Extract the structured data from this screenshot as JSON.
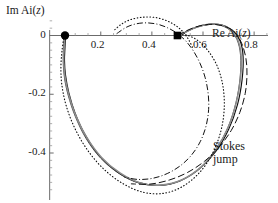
{
  "figure": {
    "kind": "complex-plane-trajectory-plot",
    "width": 278,
    "height": 203,
    "background": "#ffffff"
  },
  "axes": {
    "x_title": "Re Ai(z)",
    "y_title": "Im Ai(z)",
    "x_ticks": [
      {
        "value": 0.2,
        "label": "0.2"
      },
      {
        "value": 0.4,
        "label": "0.4"
      },
      {
        "value": 0.6,
        "label": "0.6"
      },
      {
        "value": 0.8,
        "label": "0.8"
      }
    ],
    "y_ticks": [
      {
        "value": 0.0,
        "label": "0"
      },
      {
        "value": -0.2,
        "label": "-0.2"
      },
      {
        "value": -0.4,
        "label": "-0.4"
      }
    ],
    "x_range": [
      -0.03,
      0.87
    ],
    "y_range": [
      -0.56,
      0.08
    ],
    "axis_color": "#6b6b6b"
  },
  "markers": [
    {
      "name": "start-dot",
      "shape": "circle",
      "x": 0.06,
      "y": 0.0
    },
    {
      "name": "stokes-point-square",
      "shape": "square",
      "x": 0.5,
      "y": 0.0
    }
  ],
  "annotations": [
    {
      "name": "stokes-jump-label",
      "line1": "Stokes",
      "line2": "jump"
    }
  ],
  "chart_data": {
    "type": "line",
    "title": "",
    "xlabel": "Re Ai(z)",
    "ylabel": "Im Ai(z)",
    "xlim": [
      -0.03,
      0.87
    ],
    "ylim": [
      -0.56,
      0.08
    ],
    "grid": false,
    "legend": "none",
    "series": [
      {
        "name": "solid-outer-loop",
        "style": "solid",
        "color": "#111111",
        "points": [
          [
            0.062,
            0.0
          ],
          [
            0.06,
            -0.04
          ],
          [
            0.058,
            -0.085
          ],
          [
            0.062,
            -0.135
          ],
          [
            0.075,
            -0.195
          ],
          [
            0.1,
            -0.265
          ],
          [
            0.14,
            -0.34
          ],
          [
            0.195,
            -0.41
          ],
          [
            0.265,
            -0.465
          ],
          [
            0.345,
            -0.5
          ],
          [
            0.43,
            -0.51
          ],
          [
            0.51,
            -0.495
          ],
          [
            0.585,
            -0.455
          ],
          [
            0.65,
            -0.395
          ],
          [
            0.7,
            -0.32
          ],
          [
            0.735,
            -0.235
          ],
          [
            0.753,
            -0.15
          ],
          [
            0.757,
            -0.072
          ],
          [
            0.745,
            -0.018
          ],
          [
            0.715,
            0.018
          ],
          [
            0.672,
            0.036
          ],
          [
            0.625,
            0.038
          ],
          [
            0.578,
            0.03
          ],
          [
            0.54,
            0.016
          ],
          [
            0.512,
            0.002
          ],
          [
            0.5,
            0.0
          ]
        ]
      },
      {
        "name": "solid-inner-loop",
        "style": "solid",
        "color": "#2a2a2a",
        "points": [
          [
            0.057,
            0.0
          ],
          [
            0.054,
            -0.045
          ],
          [
            0.053,
            -0.092
          ],
          [
            0.058,
            -0.145
          ],
          [
            0.073,
            -0.205
          ],
          [
            0.1,
            -0.275
          ],
          [
            0.142,
            -0.35
          ],
          [
            0.2,
            -0.418
          ],
          [
            0.272,
            -0.47
          ],
          [
            0.352,
            -0.503
          ],
          [
            0.436,
            -0.51
          ],
          [
            0.516,
            -0.492
          ],
          [
            0.589,
            -0.45
          ],
          [
            0.65,
            -0.388
          ],
          [
            0.698,
            -0.312
          ],
          [
            0.729,
            -0.228
          ],
          [
            0.745,
            -0.145
          ],
          [
            0.747,
            -0.068
          ],
          [
            0.733,
            -0.014
          ],
          [
            0.703,
            0.02
          ],
          [
            0.662,
            0.036
          ],
          [
            0.618,
            0.037
          ],
          [
            0.575,
            0.028
          ],
          [
            0.538,
            0.014
          ],
          [
            0.51,
            0.001
          ],
          [
            0.5,
            0.0
          ]
        ]
      },
      {
        "name": "gray-underlay-loop",
        "style": "solid",
        "color": "#8d8d8d",
        "points": [
          [
            0.059,
            0.0
          ],
          [
            0.056,
            -0.043
          ],
          [
            0.055,
            -0.09
          ],
          [
            0.06,
            -0.142
          ],
          [
            0.075,
            -0.202
          ],
          [
            0.102,
            -0.272
          ],
          [
            0.145,
            -0.347
          ],
          [
            0.203,
            -0.415
          ],
          [
            0.275,
            -0.468
          ],
          [
            0.355,
            -0.502
          ],
          [
            0.438,
            -0.509
          ],
          [
            0.518,
            -0.491
          ],
          [
            0.591,
            -0.449
          ],
          [
            0.652,
            -0.386
          ],
          [
            0.7,
            -0.31
          ],
          [
            0.731,
            -0.226
          ],
          [
            0.747,
            -0.143
          ],
          [
            0.749,
            -0.066
          ],
          [
            0.735,
            -0.012
          ],
          [
            0.705,
            0.022
          ],
          [
            0.664,
            0.037
          ],
          [
            0.62,
            0.038
          ],
          [
            0.577,
            0.029
          ],
          [
            0.54,
            0.015
          ],
          [
            0.512,
            0.001
          ],
          [
            0.5,
            0.0
          ]
        ]
      },
      {
        "name": "dotted-loop",
        "style": "dotted",
        "color": "#111111",
        "points": [
          [
            0.056,
            0.0
          ],
          [
            0.048,
            -0.055
          ],
          [
            0.044,
            -0.11
          ],
          [
            0.048,
            -0.17
          ],
          [
            0.065,
            -0.24
          ],
          [
            0.098,
            -0.315
          ],
          [
            0.148,
            -0.39
          ],
          [
            0.212,
            -0.455
          ],
          [
            0.288,
            -0.505
          ],
          [
            0.368,
            -0.534
          ],
          [
            0.448,
            -0.537
          ],
          [
            0.522,
            -0.513
          ],
          [
            0.588,
            -0.465
          ],
          [
            0.638,
            -0.4
          ],
          [
            0.67,
            -0.325
          ],
          [
            0.683,
            -0.248
          ],
          [
            0.678,
            -0.172
          ],
          [
            0.656,
            -0.105
          ],
          [
            0.62,
            -0.052
          ],
          [
            0.578,
            -0.016
          ],
          [
            0.534,
            0.002
          ],
          [
            0.5,
            0.0
          ]
        ]
      },
      {
        "name": "dotted-upper-arc",
        "style": "dotted",
        "color": "#111111",
        "points": [
          [
            0.255,
            0.02
          ],
          [
            0.28,
            0.038
          ],
          [
            0.31,
            0.052
          ],
          [
            0.345,
            0.06
          ],
          [
            0.38,
            0.063
          ],
          [
            0.415,
            0.061
          ],
          [
            0.45,
            0.053
          ],
          [
            0.482,
            0.04
          ],
          [
            0.508,
            0.024
          ],
          [
            0.528,
            0.006
          ],
          [
            0.545,
            -0.016
          ],
          [
            0.56,
            -0.042
          ]
        ]
      },
      {
        "name": "dashdot-loop",
        "style": "dashdot",
        "color": "#111111",
        "points": [
          [
            0.262,
            0.006
          ],
          [
            0.3,
            0.028
          ],
          [
            0.34,
            0.04
          ],
          [
            0.382,
            0.043
          ],
          [
            0.424,
            0.038
          ],
          [
            0.462,
            0.026
          ],
          [
            0.498,
            0.008
          ],
          [
            0.532,
            -0.018
          ],
          [
            0.562,
            -0.052
          ],
          [
            0.588,
            -0.094
          ],
          [
            0.608,
            -0.142
          ],
          [
            0.62,
            -0.196
          ],
          [
            0.622,
            -0.252
          ],
          [
            0.612,
            -0.308
          ],
          [
            0.59,
            -0.36
          ],
          [
            0.556,
            -0.406
          ],
          [
            0.512,
            -0.443
          ],
          [
            0.46,
            -0.47
          ],
          [
            0.404,
            -0.486
          ],
          [
            0.346,
            -0.49
          ],
          [
            0.292,
            -0.482
          ]
        ]
      },
      {
        "name": "dashed-outer-right",
        "style": "dashed",
        "color": "#111111",
        "points": [
          [
            0.5,
            0.0
          ],
          [
            0.545,
            0.02
          ],
          [
            0.592,
            0.034
          ],
          [
            0.64,
            0.038
          ],
          [
            0.688,
            0.03
          ],
          [
            0.726,
            0.01
          ],
          [
            0.752,
            -0.028
          ],
          [
            0.768,
            -0.078
          ],
          [
            0.772,
            -0.135
          ],
          [
            0.765,
            -0.198
          ],
          [
            0.744,
            -0.262
          ],
          [
            0.71,
            -0.324
          ],
          [
            0.663,
            -0.38
          ],
          [
            0.606,
            -0.428
          ],
          [
            0.54,
            -0.466
          ],
          [
            0.468,
            -0.492
          ],
          [
            0.392,
            -0.506
          ],
          [
            0.318,
            -0.505
          ]
        ]
      }
    ]
  }
}
